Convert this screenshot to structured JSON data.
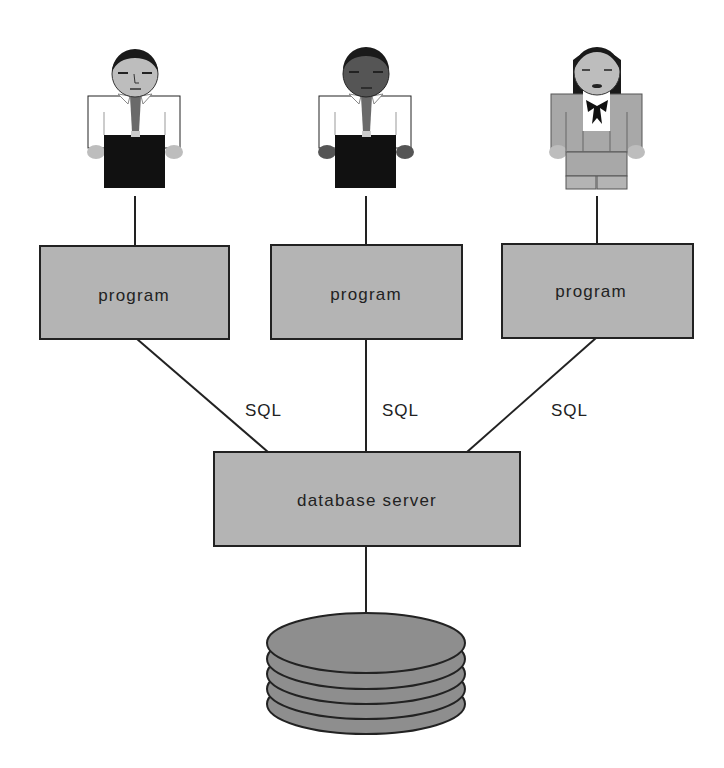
{
  "diagram": {
    "colors": {
      "background": "#ffffff",
      "box_fill": "#b4b4b4",
      "stroke": "#222222",
      "disk_fill": "#8e8e8e"
    },
    "users": [
      {
        "id": "user-1",
        "icon": "man-light-skin-icon",
        "skin": "#bdbdbd",
        "hair": "#1a1a1a",
        "shirt": "#ffffff",
        "tie": "#6a6a6a",
        "pants": "#111111"
      },
      {
        "id": "user-2",
        "icon": "man-dark-skin-icon",
        "skin": "#555555",
        "hair": "#1a1a1a",
        "shirt": "#ffffff",
        "tie": "#6a6a6a",
        "pants": "#111111"
      },
      {
        "id": "user-3",
        "icon": "woman-icon",
        "skin": "#bdbdbd",
        "hair": "#1a1a1a",
        "suit": "#a8a8a8",
        "blouse": "#ffffff",
        "bow": "#111111"
      }
    ],
    "programs": [
      {
        "label": "program"
      },
      {
        "label": "program"
      },
      {
        "label": "program"
      }
    ],
    "connections": [
      {
        "label": "SQL"
      },
      {
        "label": "SQL"
      },
      {
        "label": "SQL"
      }
    ],
    "server": {
      "label": "database server"
    },
    "storage": {
      "icon": "database-disk-stack-icon",
      "plates": 5
    }
  }
}
